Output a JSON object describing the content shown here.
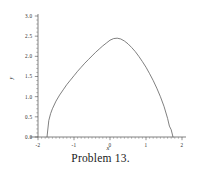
{
  "caption": "Problem 13.",
  "colors": {
    "curve": "#555555",
    "axis": "#4a4a4a",
    "text": "#1a1a1a",
    "background": "#ffffff"
  },
  "chart_data": {
    "type": "line",
    "title": "",
    "subtitle": "",
    "xlabel": "x",
    "ylabel": "y",
    "xlim": [
      -2,
      2
    ],
    "ylim": [
      0.0,
      3.0
    ],
    "grid": false,
    "legend": null,
    "xticks": [
      -2,
      -1,
      0,
      1,
      2
    ],
    "xtick_labels": [
      "-2",
      "-1",
      "0",
      "1",
      "2"
    ],
    "yticks": [
      0.0,
      0.5,
      1.0,
      1.5,
      2.0,
      2.5,
      3.0
    ],
    "ytick_labels": [
      "0.0",
      "0.5",
      "1.0",
      "1.5",
      "2.0",
      "2.5",
      "3.0"
    ],
    "x_minor_tick_step": 0.1,
    "y_minor_tick_step": 0.1,
    "annotations": [],
    "series": [
      {
        "name": "curve",
        "x": [
          -1.75,
          -1.7,
          -1.65,
          -1.6,
          -1.5,
          -1.4,
          -1.3,
          -1.2,
          -1.1,
          -1.0,
          -0.9,
          -0.8,
          -0.7,
          -0.6,
          -0.5,
          -0.4,
          -0.3,
          -0.2,
          -0.1,
          0.0,
          0.1,
          0.2,
          0.3,
          0.4,
          0.5,
          0.6,
          0.7,
          0.8,
          0.9,
          1.0,
          1.1,
          1.2,
          1.3,
          1.4,
          1.5,
          1.6,
          1.65,
          1.7,
          1.75
        ],
        "y": [
          0.0,
          0.41,
          0.58,
          0.7,
          0.89,
          1.04,
          1.17,
          1.3,
          1.41,
          1.52,
          1.63,
          1.73,
          1.83,
          1.92,
          2.01,
          2.1,
          2.18,
          2.26,
          2.33,
          2.4,
          2.44,
          2.45,
          2.43,
          2.38,
          2.31,
          2.22,
          2.12,
          2.0,
          1.87,
          1.73,
          1.57,
          1.4,
          1.21,
          1.0,
          0.76,
          0.46,
          0.27,
          0.18,
          0.0
        ]
      }
    ]
  }
}
